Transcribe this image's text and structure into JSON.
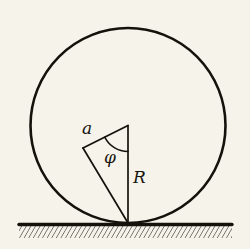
{
  "figure": {
    "background_color": "#f6f3ea",
    "ink_color": "#15120c",
    "width": 250,
    "height": 249,
    "labels": {
      "chord": "a",
      "angle": "φ",
      "radius": "R"
    },
    "geometry": {
      "circle": {
        "cx": 128,
        "cy": 125.5,
        "r": 97.5,
        "stroke_width": 2.6
      },
      "center_point": {
        "x": 128,
        "y": 125.5
      },
      "contact_point": {
        "x": 128,
        "y": 223
      },
      "chord_point": {
        "x": 83,
        "y": 148
      },
      "radius_line": {
        "x1": 128,
        "y1": 125.5,
        "x2": 128,
        "y2": 223,
        "stroke_width": 1.7
      },
      "chord_line": {
        "x1": 128,
        "y1": 125.5,
        "x2": 83,
        "y2": 148,
        "stroke_width": 1.7
      },
      "closing_line": {
        "x1": 83,
        "y1": 148,
        "x2": 128,
        "y2": 223,
        "stroke_width": 1.7
      },
      "angle_arc": {
        "cx": 128,
        "cy": 125.5,
        "r": 26,
        "stroke_width": 1.5
      },
      "ground_line": {
        "x1": 19,
        "y1": 224.5,
        "x2": 232,
        "y2": 224.5,
        "stroke_width": 3.4
      },
      "hatching": {
        "x_start": 19,
        "x_end": 232,
        "y_top": 226,
        "y_bottom": 238,
        "spacing": 4.6,
        "slant_dx": 7,
        "stroke_width": 1.1
      }
    },
    "label_positions": {
      "chord": {
        "x": 82,
        "y": 134
      },
      "angle": {
        "x": 104,
        "y": 163
      },
      "radius": {
        "x": 133,
        "y": 183
      }
    }
  }
}
